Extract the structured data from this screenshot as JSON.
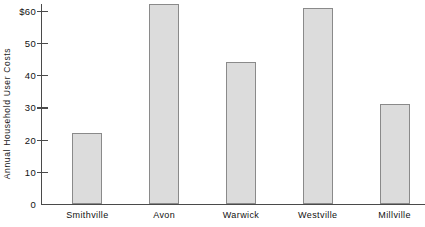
{
  "chart_data": {
    "type": "bar",
    "title": "",
    "xlabel": "",
    "ylabel": "Annual Household User Costs",
    "categories": [
      "Smithville",
      "Avon",
      "Warwick",
      "Westville",
      "Millville"
    ],
    "values": [
      22,
      62,
      44,
      61,
      31
    ],
    "ylim": [
      0,
      62
    ],
    "yticks": [
      0,
      10,
      20,
      30,
      40,
      50,
      60
    ],
    "ytick_labels": [
      "0",
      "10",
      "20",
      "30",
      "40",
      "50",
      "$60"
    ],
    "grid": false,
    "legend": null,
    "bar_fill_color": "#dcdcdc",
    "bar_border_color": "#8a8a8a",
    "axis_color": "#4a4a4a",
    "text_color": "#111111",
    "background_color": "#ffffff"
  }
}
